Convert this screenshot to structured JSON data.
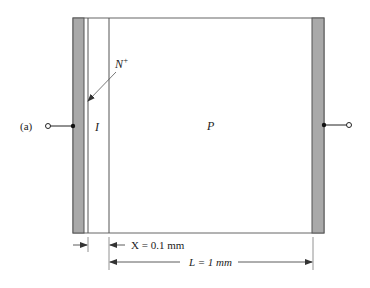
{
  "figure": {
    "panel_label": "(a)",
    "regions": {
      "n_plus": "N",
      "n_plus_sup": "+",
      "intrinsic": "I",
      "p": "P"
    },
    "dimensions": {
      "x_label": "X = 0.1 mm",
      "l_label": "L = 1 mm"
    },
    "colors": {
      "contact_fill": "#a9a9a9",
      "line": "#555555"
    }
  }
}
